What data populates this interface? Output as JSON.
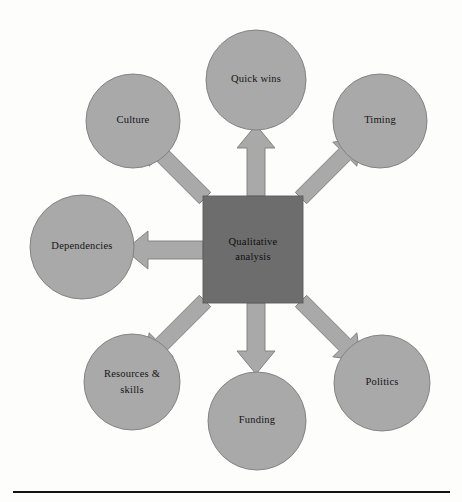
{
  "diagram": {
    "type": "hub-and-spoke",
    "title_text": "",
    "center": {
      "shape": "square",
      "label_lines": [
        "Qualitative",
        "analysis"
      ],
      "label_full": "Qualitative analysis",
      "fill_color": "#6d6d6d",
      "text_color": "#0d0d0d",
      "x": 203,
      "y": 196,
      "width": 100,
      "height": 107
    },
    "node_fill_color": "#a9a9a9",
    "node_stroke_color": "#7d7d7d",
    "arrow_fill_color": "#a9a9a9",
    "background_color": "#fdfdfc",
    "nodes": [
      {
        "id": "culture",
        "label_lines": [
          "Culture"
        ],
        "label_full": "Culture",
        "cx": 133,
        "cy": 121,
        "r": 47,
        "arrow_direction": "down-right"
      },
      {
        "id": "quick-wins",
        "label_lines": [
          "Quick wins"
        ],
        "label_full": "Quick wins",
        "cx": 256,
        "cy": 80,
        "r": 50,
        "arrow_direction": "down"
      },
      {
        "id": "timing",
        "label_lines": [
          "Timing"
        ],
        "label_full": "Timing",
        "cx": 380,
        "cy": 121,
        "r": 47,
        "arrow_direction": "down-left"
      },
      {
        "id": "dependencies",
        "label_lines": [
          "Dependencies"
        ],
        "label_full": "Dependencies",
        "cx": 82,
        "cy": 247,
        "r": 52,
        "arrow_direction": "right"
      },
      {
        "id": "politics",
        "label_lines": [
          "Politics"
        ],
        "label_full": "Politics",
        "cx": 382,
        "cy": 383,
        "r": 48,
        "arrow_direction": "up-left"
      },
      {
        "id": "resources-skills",
        "label_lines": [
          "Resources &",
          "skills"
        ],
        "label_full": "Resources & skills",
        "cx": 132,
        "cy": 382,
        "r": 48,
        "arrow_direction": "up-right"
      },
      {
        "id": "funding",
        "label_lines": [
          "Funding"
        ],
        "label_full": "Funding",
        "cx": 257,
        "cy": 421,
        "r": 49,
        "arrow_direction": "up"
      }
    ]
  },
  "footer": {
    "rule_present": true,
    "rule_color": "#111111",
    "rule_x_start": 13,
    "rule_x_end": 450,
    "rule_y": 492
  }
}
